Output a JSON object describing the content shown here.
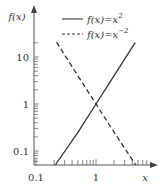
{
  "chart_data": {
    "type": "line",
    "title": "",
    "xlabel": "x",
    "ylabel": "f(x)",
    "xscale": "log",
    "yscale": "log",
    "xlim": [
      0.1,
      10
    ],
    "ylim": [
      0.05,
      30
    ],
    "x_tick_labels": [
      "0.1",
      "1"
    ],
    "y_tick_labels": [
      "0.1",
      "1",
      "10"
    ],
    "grid": false,
    "legend_position": "upper right",
    "series": [
      {
        "name": "f(x)=x^2",
        "style": "solid",
        "color": "#333333",
        "x": [
          0.21,
          0.5,
          1,
          2,
          4.5
        ],
        "y": [
          0.044,
          0.25,
          1,
          4,
          20.25
        ]
      },
      {
        "name": "f(x)=x^-2",
        "style": "dashed",
        "color": "#333333",
        "x": [
          0.22,
          0.5,
          1,
          2,
          4.6
        ],
        "y": [
          20.7,
          4,
          1,
          0.25,
          0.047
        ]
      }
    ]
  },
  "axes": {
    "y_label": "f(x)",
    "x_label": "x",
    "y_ticks": [
      {
        "label": "10",
        "value": 10
      },
      {
        "label": "1",
        "value": 1
      },
      {
        "label": "0.1",
        "value": 0.1
      }
    ],
    "x_ticks": [
      {
        "label": "0.1",
        "value": 0.1
      },
      {
        "label": "1",
        "value": 1
      }
    ]
  },
  "legend": {
    "items": [
      {
        "base": "f(x)=x",
        "exponent": "2",
        "style": "solid"
      },
      {
        "base": "f(x)=x",
        "exponent": "−2",
        "style": "dashed"
      }
    ]
  },
  "colors": {
    "axis": "#555555",
    "line": "#333333",
    "text": "#333333"
  }
}
